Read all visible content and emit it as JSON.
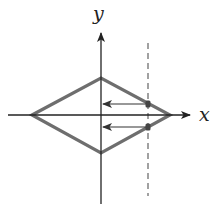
{
  "diagram": {
    "type": "coordinate-plot",
    "labels": {
      "x_axis": "x",
      "y_axis": "y"
    },
    "colors": {
      "axes": "#222222",
      "diamond": "#6e6e6e",
      "dashed_line": "#7a7a7a",
      "arrows": "#333333",
      "points": "#444444",
      "background": "#ffffff"
    },
    "axes": {
      "origin": [
        101,
        115
      ],
      "x_axis": {
        "from": [
          8,
          115
        ],
        "to": [
          190,
          115
        ]
      },
      "y_axis": {
        "from": [
          101,
          204
        ],
        "to": [
          101,
          33
        ]
      }
    },
    "diamond": {
      "vertices": [
        [
          32,
          115
        ],
        [
          101,
          78
        ],
        [
          170,
          115
        ],
        [
          101,
          153
        ]
      ]
    },
    "dashed_line": {
      "x": 148,
      "y_from": 43,
      "y_to": 196
    },
    "arrows": [
      {
        "from": [
          148,
          104
        ],
        "to": [
          102,
          104
        ]
      },
      {
        "from": [
          148,
          127
        ],
        "to": [
          102,
          127
        ]
      }
    ],
    "points": [
      [
        148,
        104
      ],
      [
        148,
        127
      ]
    ]
  }
}
